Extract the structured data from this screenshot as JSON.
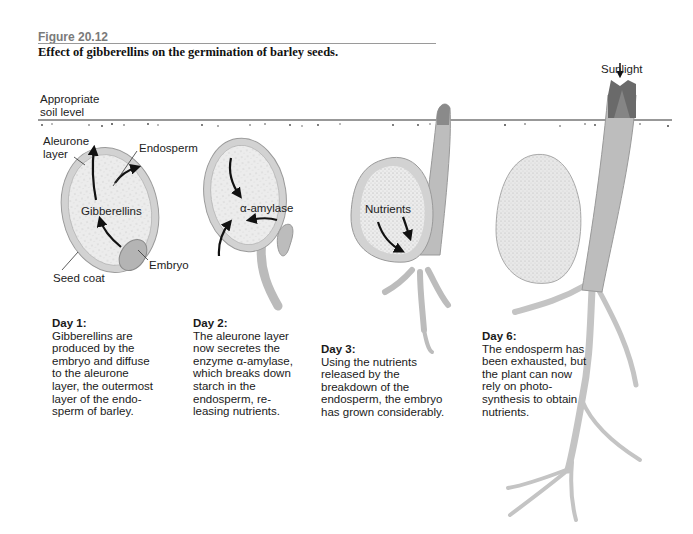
{
  "figure": {
    "label": "Figure 20.12",
    "title": "Effect of gibberellins on the germination of barley seeds."
  },
  "labels": {
    "soil_level": "Appropriate\nsoil level",
    "aleurone_layer": "Aleurone\nlayer",
    "endosperm": "Endosperm",
    "gibberellins": "Gibberellins",
    "embryo": "Embryo",
    "seed_coat": "Seed coat",
    "alpha_amylase": "α-amylase",
    "nutrients": "Nutrients",
    "sunlight": "Sunlight"
  },
  "stages": [
    {
      "day": "Day 1:",
      "text": "Gibberellins are\nproduced by the\nembryo and diffuse\nto the aleurone\nlayer, the outermost\nlayer of the endo-\nsperm of barley."
    },
    {
      "day": "Day 2:",
      "text": "The aleurone layer\nnow secretes the\nenzyme α-amylase,\nwhich breaks down\nstarch in the\nendosperm, re-\nleasing nutrients."
    },
    {
      "day": "Day 3:",
      "text": "Using the nutrients\nreleased by the\nbreakdown of the\nendosperm, the embryo\nhas grown considerably."
    },
    {
      "day": "Day 6:",
      "text": "The endosperm has\nbeen exhausted, but\nthe plant can now\nrely on photo-\nsynthesis to obtain\nnutrients."
    }
  ],
  "colors": {
    "seed_fill": "#e6e6e6",
    "aleurone": "#c8c8c8",
    "shoot": "#bdbdbd",
    "shoot_tip": "#6a6a6a",
    "arrow": "#111111",
    "soil_line": "#333333"
  }
}
